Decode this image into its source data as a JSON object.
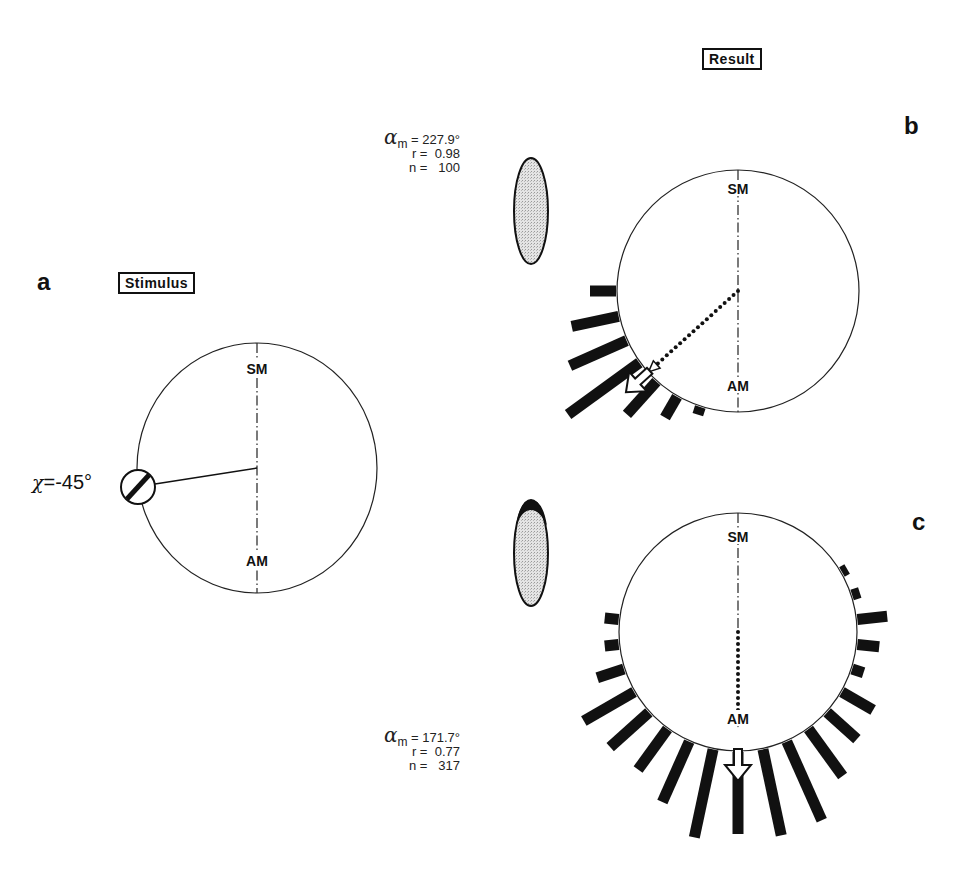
{
  "figure": {
    "panels": [
      {
        "id": "a",
        "letter": "a",
        "box_label": "Stimulus",
        "axis_top": "SM",
        "axis_bottom": "AM",
        "circle": {
          "cx": 257,
          "cy": 468,
          "rx": 120,
          "ry": 125
        },
        "stimulus": {
          "label_symbol": "χ",
          "label_value": "=-45°",
          "angle_deg": 263,
          "marker": "polarizer-disc"
        }
      },
      {
        "id": "b",
        "letter": "b",
        "box_label": "Result",
        "axis_top": "SM",
        "axis_bottom": "AM",
        "stats": {
          "alpha_symbol": "α",
          "alpha_sub": "m",
          "alpha_value": "= 227.9°",
          "r_label": "r =",
          "r_value": "0.98",
          "n_label": "n =",
          "n_value": "100"
        },
        "circle": {
          "cx": 738,
          "cy": 291,
          "r": 121
        },
        "mean_angle": 227.9,
        "mean_vector_length": 0.98
      },
      {
        "id": "c",
        "letter": "c",
        "axis_top": "SM",
        "axis_bottom": "AM",
        "stats": {
          "alpha_symbol": "α",
          "alpha_sub": "m",
          "alpha_value": "= 171.7°",
          "r_label": "r =",
          "r_value": "0.77",
          "n_label": "n =",
          "n_value": "317"
        },
        "circle": {
          "cx": 738,
          "cy": 632,
          "r": 119
        },
        "mean_angle": 171.7,
        "mean_vector_length": 0.77
      }
    ]
  },
  "chart_data": [
    {
      "type": "circular-histogram",
      "title": "b",
      "subtitle": "Result",
      "axis_labels": {
        "top": "SM",
        "bottom": "AM"
      },
      "bin_width_deg": 12,
      "angles_deg": [
        198,
        210,
        222,
        234,
        246,
        258,
        270
      ],
      "lengths_px": [
        8,
        24,
        44,
        88,
        62,
        48,
        26
      ],
      "mean_angle_deg": 227.9,
      "r": 0.98,
      "n": 100
    },
    {
      "type": "circular-histogram",
      "title": "c",
      "axis_labels": {
        "top": "SM",
        "bottom": "AM"
      },
      "bin_width_deg": 12,
      "angles_deg": [
        60,
        72,
        84,
        96,
        108,
        120,
        132,
        144,
        156,
        168,
        180,
        192,
        204,
        216,
        228,
        240,
        252,
        264,
        276
      ],
      "lengths_px": [
        6,
        8,
        30,
        22,
        12,
        36,
        40,
        58,
        86,
        88,
        82,
        90,
        66,
        50,
        52,
        58,
        28,
        14,
        14
      ],
      "mean_angle_deg": 171.7,
      "r": 0.77,
      "n": 317
    }
  ],
  "stimulus_panel": {
    "orientation_label": "χ=-45°",
    "box_label": "Stimulus"
  }
}
